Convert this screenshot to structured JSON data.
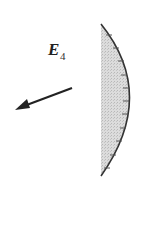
{
  "diagram": {
    "label": {
      "symbol": "E",
      "subscript": "4"
    },
    "elements": [
      {
        "type": "arrow",
        "direction": "down-left",
        "meaning": "field vector"
      },
      {
        "type": "concave-mirror",
        "fill": "stippled gray",
        "ticks": 11
      }
    ],
    "colors": {
      "stroke": "#333333",
      "mirror_fill": "#d8d8d8",
      "background": "#ffffff"
    }
  }
}
